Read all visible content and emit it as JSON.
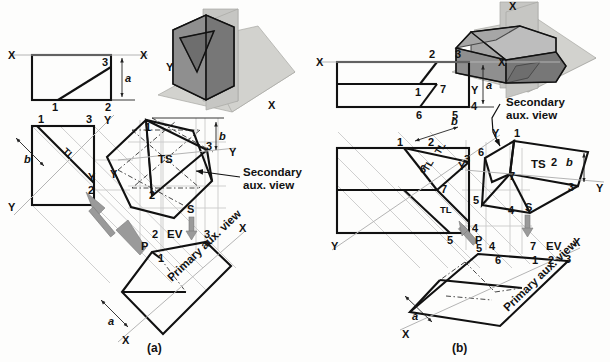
{
  "figure": {
    "panels": [
      {
        "id": "a",
        "caption": "(a)",
        "pictorial": {
          "description": "isometric-solid-with-cutting-planes",
          "axis_labels": [
            "Y",
            "X"
          ]
        },
        "views": {
          "top_view": {
            "vertex_labels": [
              "1",
              "2",
              "3"
            ],
            "ref_labels": [
              "X",
              "X"
            ],
            "dimension": "a"
          },
          "front_view": {
            "vertex_labels": [
              "1",
              "3",
              "2"
            ],
            "ref_labels": [
              "Y",
              "Y",
              "Y"
            ],
            "dimension": "b",
            "true_length_label": "TL"
          },
          "primary_aux_view": {
            "vertex_labels": [
              "2",
              "1",
              "3"
            ],
            "ref_labels": [
              "X",
              "X"
            ],
            "dimension": "a",
            "edge_view_label": "EV",
            "name": "Primary aux. view",
            "direction_label": "P"
          },
          "secondary_aux_view": {
            "vertex_labels": [
              "1",
              "2",
              "3"
            ],
            "ref_labels": [
              "Y",
              "Y"
            ],
            "dimension": "b",
            "true_size_label": "TS",
            "name": "Secondary aux. view",
            "direction_label": "S"
          }
        }
      },
      {
        "id": "b",
        "caption": "(b)",
        "pictorial": {
          "description": "isometric-prism-with-cutting-planes",
          "axis_labels": [
            "X",
            "Y"
          ]
        },
        "views": {
          "top_view": {
            "vertex_labels": [
              "2",
              "3",
              "1",
              "7",
              "4",
              "6",
              "5"
            ],
            "ref_labels": [
              "X",
              "X"
            ],
            "dimension": "a"
          },
          "front_view": {
            "vertex_labels": [
              "1",
              "2",
              "3",
              "6",
              "7",
              "5",
              "4"
            ],
            "ref_labels": [
              "Y",
              "Y"
            ],
            "dimension": "b",
            "true_length_labels": [
              "TL",
              "TL",
              "TL"
            ]
          },
          "primary_aux_view": {
            "vertex_labels": [
              "5",
              "4",
              "6",
              "7",
              "1",
              "2",
              "3"
            ],
            "ref_labels": [
              "X",
              "X"
            ],
            "dimension": "a",
            "edge_view_label": "EV",
            "name": "Primary aux. view",
            "direction_label": "P"
          },
          "secondary_aux_view": {
            "vertex_labels": [
              "1",
              "6",
              "7",
              "2",
              "3",
              "5",
              "4"
            ],
            "ref_labels": [
              "Y",
              "Y"
            ],
            "dimension": "b",
            "true_size_label": "TS",
            "name": "Secondary aux. view",
            "direction_label": "S"
          }
        }
      }
    ],
    "colors": {
      "ink": "#111111",
      "projection_line": "#c9c9c9",
      "reference_line": "#b4b4b4",
      "plane_fill": "#c6c6c3",
      "solid_fill": "#8f8f8f",
      "arrow_gray": "#9a9a9a",
      "background": "#fdfdfc"
    }
  }
}
